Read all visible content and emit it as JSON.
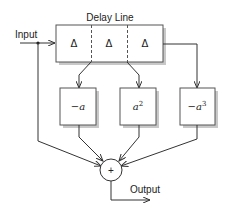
{
  "diagram": {
    "title": "Delay Line",
    "input_label": "Input",
    "output_label": "Output",
    "delay_cells": [
      "Δ",
      "Δ",
      "Δ"
    ],
    "taps": [
      {
        "id": "tap-1",
        "label_prefix": "−",
        "label_var": "a",
        "label_sup": ""
      },
      {
        "id": "tap-2",
        "label_prefix": "",
        "label_var": "a",
        "label_sup": "2"
      },
      {
        "id": "tap-3",
        "label_prefix": "−",
        "label_var": "a",
        "label_sup": "3"
      }
    ],
    "summer_symbol": "+"
  }
}
